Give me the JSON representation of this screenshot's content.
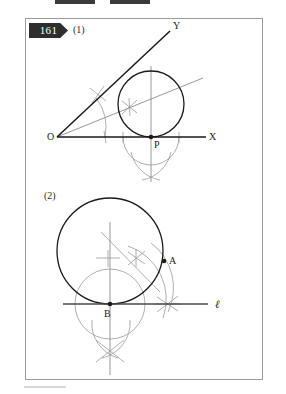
{
  "page": {
    "problem_number": "161",
    "frame": {
      "x": 25,
      "y": 18,
      "w": 238,
      "h": 362
    },
    "top_bars": [
      {
        "x": 55,
        "w": 40
      },
      {
        "x": 110,
        "w": 40
      }
    ]
  },
  "colors": {
    "ink": "#1a1a1a",
    "construction": "#9a9a9a",
    "frame": "#9a9a9a",
    "badge_bg": "#2e2e2e",
    "badge_text": "#ffffff"
  },
  "figures": [
    {
      "id": "fig1",
      "label": "(1)",
      "description": "Angle XOY with inscribed circle tangent to ray OX at P",
      "points": [
        {
          "name": "O",
          "label": "O",
          "x": 57,
          "y": 137,
          "label_dx": -10,
          "label_dy": 3,
          "dot": false
        },
        {
          "name": "P",
          "label": "P",
          "x": 151,
          "y": 137,
          "label_dx": 3,
          "label_dy": 11,
          "dot": true
        },
        {
          "name": "X",
          "label": "X",
          "x": 212,
          "y": 137,
          "label_dx": 5,
          "label_dy": 3,
          "dot": false
        },
        {
          "name": "Y",
          "label": "Y",
          "x": 170,
          "y": 31,
          "label_dx": 4,
          "label_dy": -2,
          "dot": false
        }
      ],
      "rays": [
        {
          "name": "ray-OX",
          "x1": 57,
          "y1": 137,
          "x2": 206,
          "y2": 137
        },
        {
          "name": "ray-OY",
          "x1": 57,
          "y1": 137,
          "x2": 170,
          "y2": 31
        }
      ],
      "bisector": {
        "name": "angle-bisector",
        "x1": 57,
        "y1": 137,
        "x2": 203,
        "y2": 78
      },
      "circle": {
        "name": "inscribed-circle",
        "cx": 151,
        "cy": 104,
        "r": 33
      },
      "vertical": {
        "name": "perpendicular-at-P",
        "x1": 151,
        "y1": 69,
        "x2": 151,
        "y2": 178
      }
    },
    {
      "id": "fig2",
      "label": "(2)",
      "description": "Circle through A tangent to line l at B",
      "points": [
        {
          "name": "A",
          "label": "A",
          "x": 164,
          "y": 261,
          "label_dx": 4,
          "label_dy": 3,
          "dot": true
        },
        {
          "name": "B",
          "label": "B",
          "x": 110,
          "y": 304,
          "label_dx": -4,
          "label_dy": 12,
          "dot": true
        }
      ],
      "line": {
        "name": "line-l",
        "label": "ℓ",
        "x1": 63,
        "y1": 304,
        "x2": 208,
        "y2": 304,
        "label_x": 216,
        "label_y": 307
      },
      "circle": {
        "name": "circumscribed-circle",
        "cx": 110,
        "cy": 251,
        "r": 53
      },
      "vertical": {
        "name": "perpendicular-at-B",
        "x1": 110,
        "y1": 222,
        "x2": 110,
        "y2": 375
      }
    }
  ]
}
